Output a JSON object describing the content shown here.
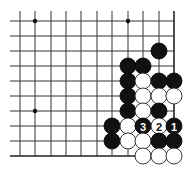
{
  "board": {
    "colors": {
      "black": "#111111",
      "white": "#ffffff",
      "line": "#333333",
      "background": "#ffffff"
    },
    "columns_x": [
      20,
      35,
      51,
      66,
      81,
      97,
      112,
      128,
      143,
      159,
      174
    ],
    "rows_y": [
      21,
      36,
      51,
      66,
      81,
      96,
      111,
      126,
      141,
      156
    ],
    "left_extent": 10,
    "top_extent": 11,
    "right_edge": true,
    "bottom_edge": true,
    "bottom_line_end_x": 136,
    "stone_radius": 8,
    "star_points": [
      {
        "col": 1,
        "row": 0
      },
      {
        "col": 7,
        "row": 0
      },
      {
        "col": 1,
        "row": 6
      }
    ],
    "stones": [
      {
        "col": 9,
        "row": 2,
        "color": "black"
      },
      {
        "col": 7,
        "row": 3,
        "color": "black"
      },
      {
        "col": 8,
        "row": 3,
        "color": "black"
      },
      {
        "col": 7,
        "row": 4,
        "color": "black"
      },
      {
        "col": 8,
        "row": 4,
        "color": "white"
      },
      {
        "col": 9,
        "row": 4,
        "color": "black"
      },
      {
        "col": 10,
        "row": 4,
        "color": "black"
      },
      {
        "col": 7,
        "row": 5,
        "color": "black"
      },
      {
        "col": 8,
        "row": 5,
        "color": "white"
      },
      {
        "col": 9,
        "row": 5,
        "color": "white"
      },
      {
        "col": 10,
        "row": 5,
        "color": "white"
      },
      {
        "col": 7,
        "row": 6,
        "color": "black"
      },
      {
        "col": 8,
        "row": 6,
        "color": "white"
      },
      {
        "col": 9,
        "row": 6,
        "color": "black"
      },
      {
        "col": 6,
        "row": 7,
        "color": "black"
      },
      {
        "col": 7,
        "row": 7,
        "color": "white"
      },
      {
        "col": 8,
        "row": 7,
        "color": "black",
        "label": "3"
      },
      {
        "col": 9,
        "row": 7,
        "color": "white",
        "label": "2"
      },
      {
        "col": 10,
        "row": 7,
        "color": "black",
        "label": "1"
      },
      {
        "col": 6,
        "row": 8,
        "color": "black"
      },
      {
        "col": 7,
        "row": 8,
        "color": "white"
      },
      {
        "col": 8,
        "row": 8,
        "color": "white"
      },
      {
        "col": 9,
        "row": 8,
        "color": "black"
      },
      {
        "col": 10,
        "row": 8,
        "color": "black"
      },
      {
        "col": 8,
        "row": 9,
        "color": "white"
      },
      {
        "col": 9,
        "row": 9,
        "color": "white"
      },
      {
        "col": 10,
        "row": 9,
        "color": "white"
      }
    ]
  }
}
